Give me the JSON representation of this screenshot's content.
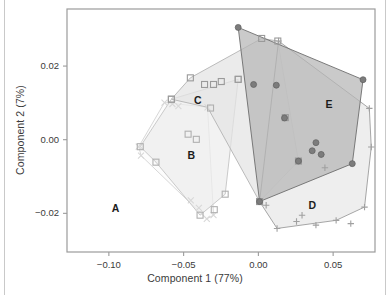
{
  "chart_data": {
    "type": "scatter",
    "title": "",
    "subtitle": "",
    "xlabel": "Component 1 (77%)",
    "ylabel": "Component 2 (7%)",
    "xticks": [
      -0.1,
      -0.05,
      0.0,
      0.05
    ],
    "xtick_labels": [
      "−0.10",
      "−0.05",
      "0.00",
      "0.05"
    ],
    "yticks": [
      0.02,
      0.0,
      -0.02
    ],
    "ytick_labels": [
      "0.02",
      "0.00",
      "−0.02"
    ],
    "xlim": [
      -0.128,
      0.078
    ],
    "ylim": [
      -0.0305,
      0.0355
    ],
    "grid": false,
    "legend": "none",
    "annotations": [
      {
        "text": "A",
        "x": -0.0955,
        "y": -0.0188
      },
      {
        "text": "B",
        "x": -0.0448,
        "y": -0.0046
      },
      {
        "text": "C",
        "x": -0.0405,
        "y": 0.0105
      },
      {
        "text": "D",
        "x": 0.036,
        "y": -0.018
      },
      {
        "text": "E",
        "x": 0.0472,
        "y": 0.0094
      }
    ],
    "series": [
      {
        "name": "A",
        "label": "A",
        "marker": "cross-x",
        "marker_color": "#d8d8d8",
        "fill": "#fbfbfb",
        "stroke": "#d3d3d3",
        "points": [
          [
            -0.08,
            -0.0019
          ],
          [
            -0.0785,
            -0.0043
          ],
          [
            -0.0628,
            0.0101
          ],
          [
            -0.0575,
            0.0097
          ],
          [
            -0.0535,
            0.0091
          ],
          [
            -0.0452,
            -0.0165
          ],
          [
            -0.0398,
            -0.0185
          ],
          [
            -0.0345,
            -0.0215
          ],
          [
            -0.03,
            -0.0205
          ],
          [
            -0.034,
            0.0088
          ]
        ],
        "hull": [
          [
            -0.08,
            -0.0019
          ],
          [
            -0.0785,
            -0.0043
          ],
          [
            -0.0345,
            -0.0215
          ],
          [
            -0.03,
            -0.0205
          ],
          [
            -0.034,
            0.0088
          ],
          [
            -0.0628,
            0.0101
          ]
        ]
      },
      {
        "name": "B",
        "label": "B",
        "marker": "open-square",
        "marker_color": "#b0b0b0",
        "fill": "#ededed",
        "stroke": "#c4c4c4",
        "points": [
          [
            -0.079,
            -0.0019
          ],
          [
            -0.0685,
            -0.0061
          ],
          [
            -0.0582,
            0.011
          ],
          [
            -0.047,
            0.0015
          ],
          [
            -0.0415,
            0.0001
          ],
          [
            -0.039,
            -0.0205
          ],
          [
            -0.032,
            0.0086
          ],
          [
            -0.0295,
            -0.019
          ],
          [
            -0.0222,
            -0.0148
          ],
          [
            -0.0135,
            0.0164
          ]
        ],
        "hull": [
          [
            -0.079,
            -0.0019
          ],
          [
            -0.0685,
            -0.0061
          ],
          [
            -0.039,
            -0.0205
          ],
          [
            -0.0222,
            -0.0148
          ],
          [
            -0.0135,
            0.0164
          ],
          [
            -0.0582,
            0.011
          ]
        ]
      },
      {
        "name": "C",
        "label": "C",
        "marker": "open-square",
        "marker_color": "#9a9a9a",
        "fill": "#e3e3e3",
        "stroke": "#b4b4b4",
        "points": [
          [
            -0.0582,
            0.011
          ],
          [
            -0.0455,
            0.0168
          ],
          [
            -0.036,
            0.015
          ],
          [
            -0.03,
            0.015
          ],
          [
            -0.0248,
            0.0158
          ],
          [
            -0.0135,
            0.0164
          ],
          [
            0.0022,
            0.0275
          ],
          [
            0.013,
            0.0268
          ],
          [
            0.018,
            0.006
          ],
          [
            0.0268,
            -0.0058
          ],
          [
            0.0008,
            -0.0168
          ]
        ],
        "hull": [
          [
            -0.0582,
            0.011
          ],
          [
            -0.0455,
            0.0168
          ],
          [
            0.0022,
            0.0275
          ],
          [
            0.013,
            0.0268
          ],
          [
            0.0268,
            -0.0058
          ],
          [
            0.0008,
            -0.0168
          ],
          [
            -0.034,
            0.0088
          ]
        ]
      },
      {
        "name": "D",
        "label": "D",
        "marker": "cross-plus",
        "marker_color": "#a0a0a0",
        "fill": "#e8e8e8",
        "stroke": "#9c9c9c",
        "points": [
          [
            0.0008,
            -0.0168
          ],
          [
            0.0052,
            -0.0178
          ],
          [
            0.0125,
            -0.0241
          ],
          [
            0.0255,
            -0.0222
          ],
          [
            0.0292,
            -0.0205
          ],
          [
            0.0385,
            -0.0232
          ],
          [
            0.042,
            -0.004
          ],
          [
            0.0445,
            -0.0076
          ],
          [
            0.052,
            -0.0219
          ],
          [
            0.0618,
            -0.0228
          ],
          [
            0.071,
            -0.0183
          ],
          [
            0.0742,
            0.0085
          ],
          [
            0.0755,
            -0.002
          ],
          [
            0.0135,
            0.0268
          ]
        ],
        "hull": [
          [
            0.0008,
            -0.0168
          ],
          [
            0.0125,
            -0.0241
          ],
          [
            0.052,
            -0.0219
          ],
          [
            0.071,
            -0.0183
          ],
          [
            0.0755,
            -0.002
          ],
          [
            0.0742,
            0.0085
          ],
          [
            0.0135,
            0.0268
          ]
        ]
      },
      {
        "name": "E",
        "label": "E",
        "marker": "filled-circle",
        "marker_color": "#7c7c7c",
        "fill": "#b5b5b5",
        "stroke": "#6e6e6e",
        "points": [
          [
            -0.0135,
            0.0305
          ],
          [
            -0.0032,
            0.015
          ],
          [
            0.012,
            0.0148
          ],
          [
            0.0175,
            0.0059
          ],
          [
            0.0268,
            -0.0058
          ],
          [
            0.0385,
            -0.0008
          ],
          [
            0.036,
            -0.003
          ],
          [
            0.042,
            -0.004
          ],
          [
            0.0628,
            -0.0065
          ],
          [
            0.07,
            0.0163
          ],
          [
            0.0008,
            -0.0168
          ]
        ],
        "hull": [
          [
            -0.0135,
            0.0305
          ],
          [
            0.07,
            0.0163
          ],
          [
            0.0628,
            -0.0065
          ],
          [
            0.0008,
            -0.0168
          ]
        ]
      }
    ]
  },
  "plot_frame": {
    "left": 67,
    "top": 9,
    "right": 375,
    "bottom": 252,
    "border_color": "#9b9b9b"
  }
}
